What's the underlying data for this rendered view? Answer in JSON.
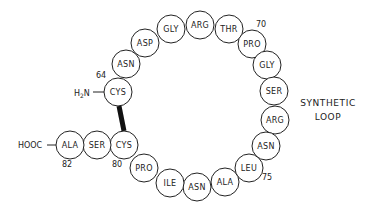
{
  "diagram": {
    "type": "peptide-loop",
    "loop_label_line1": "SYNTHETIC",
    "loop_label_line2": "LOOP",
    "n_terminus": "H2N",
    "c_terminus": "HOOC",
    "residues": [
      {
        "name": "CYS",
        "number": "64",
        "cx": 118,
        "cy": 92
      },
      {
        "name": "ASN",
        "cx": 126,
        "cy": 64
      },
      {
        "name": "ASP",
        "cx": 145,
        "cy": 43
      },
      {
        "name": "GLY",
        "cx": 171,
        "cy": 29
      },
      {
        "name": "ARG",
        "cx": 200,
        "cy": 25
      },
      {
        "name": "THR",
        "cx": 229,
        "cy": 29
      },
      {
        "name": "PRO",
        "number": "70",
        "cx": 252,
        "cy": 44
      },
      {
        "name": "GLY",
        "cx": 267,
        "cy": 65
      },
      {
        "name": "SER",
        "cx": 274,
        "cy": 91
      },
      {
        "name": "ARG",
        "cx": 275,
        "cy": 120
      },
      {
        "name": "ASN",
        "cx": 266,
        "cy": 146
      },
      {
        "name": "LEU",
        "cx": 249,
        "cy": 168
      },
      {
        "name": "ALA",
        "number": "75",
        "cx": 225,
        "cy": 182
      },
      {
        "name": "ASN",
        "cx": 197,
        "cy": 187
      },
      {
        "name": "ILE",
        "cx": 170,
        "cy": 183
      },
      {
        "name": "PRO",
        "cx": 144,
        "cy": 168
      },
      {
        "name": "CYS",
        "number": "80",
        "cx": 124,
        "cy": 145
      },
      {
        "name": "SER",
        "cx": 97,
        "cy": 145
      },
      {
        "name": "ALA",
        "number": "82",
        "cx": 70,
        "cy": 145
      }
    ],
    "disulfide_bond": {
      "from": "CYS64",
      "to": "CYS80"
    },
    "numbers": {
      "n64": "64",
      "n70": "70",
      "n75": "75",
      "n80": "80",
      "n82": "82"
    },
    "colors": {
      "stroke": "#222222",
      "background": "#ffffff"
    }
  }
}
